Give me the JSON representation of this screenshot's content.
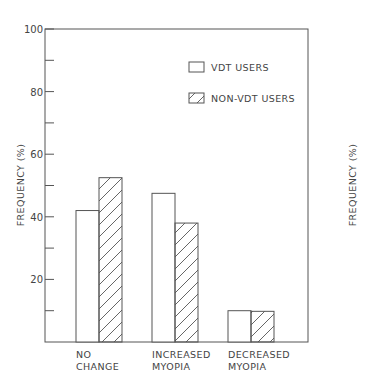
{
  "chart_data": {
    "type": "bar",
    "title": "",
    "xlabel": "",
    "ylabel": "FREQUENCY (%)",
    "ylim": [
      0,
      100
    ],
    "yticks": [
      20,
      40,
      60,
      80,
      100
    ],
    "minor_ytick_step": 10,
    "grid": false,
    "legend_position": "upper right inside",
    "categories": [
      [
        "NO",
        "CHANGE"
      ],
      [
        "INCREASED",
        "MYOPIA"
      ],
      [
        "DECREASED",
        "MYOPIA"
      ]
    ],
    "series": [
      {
        "name": "VDT USERS",
        "pattern": "open",
        "values": [
          42,
          47.5,
          10
        ]
      },
      {
        "name": "NON-VDT USERS",
        "pattern": "hatched",
        "values": [
          52.5,
          38,
          9.8
        ]
      }
    ],
    "extra_labels": {
      "right_axis_label": "FREQUENCY (%)"
    }
  },
  "colors": {
    "stroke": "#555555",
    "text": "#444444",
    "background": "#ffffff"
  }
}
